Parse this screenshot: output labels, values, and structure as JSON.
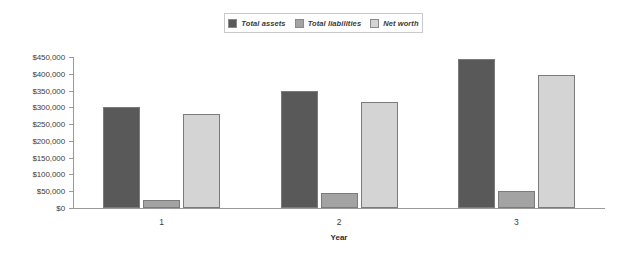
{
  "chart_data": {
    "type": "bar",
    "title": "",
    "xlabel": "Year",
    "ylabel": "",
    "categories": [
      "1",
      "2",
      "3"
    ],
    "series": [
      {
        "name": "Total assets",
        "color": "#595959",
        "values": [
          300000,
          350000,
          445000
        ]
      },
      {
        "name": "Total liabilities",
        "color": "#a3a3a3",
        "values": [
          25000,
          45000,
          52000
        ]
      },
      {
        "name": "Net worth",
        "color": "#d4d4d4",
        "values": [
          280000,
          315000,
          397000
        ]
      }
    ],
    "ylim": [
      0,
      450000
    ],
    "ytick_values": [
      0,
      50000,
      100000,
      150000,
      200000,
      250000,
      300000,
      350000,
      400000,
      450000
    ],
    "ytick_labels": [
      "$0",
      "$50,000",
      "$100,000",
      "$150,000",
      "$200,000",
      "$250,000",
      "$300,000",
      "$350,000",
      "$400,000",
      "$450,000"
    ],
    "grid": false,
    "legend_position": "top-center"
  },
  "legend": {
    "items": [
      {
        "label": "Total assets",
        "swatch": "#595959"
      },
      {
        "label": "Total liabilities",
        "swatch": "#a3a3a3"
      },
      {
        "label": "Net worth",
        "swatch": "#d4d4d4"
      }
    ]
  },
  "axes": {
    "x_title": "Year"
  }
}
